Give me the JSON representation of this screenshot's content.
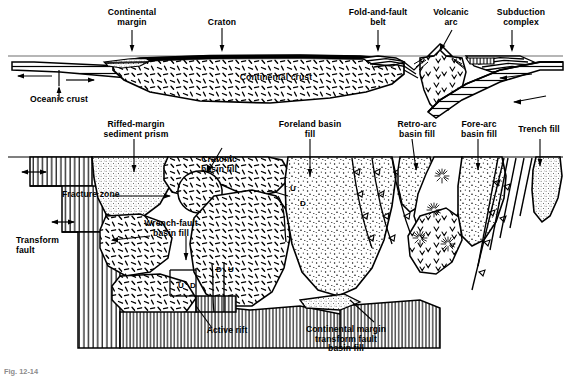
{
  "figure": {
    "kind": "geologic-cross-section",
    "caption": "Fig. 12-14",
    "panels": [
      {
        "name": "upper-panel",
        "title": "plate-tectonic settings"
      },
      {
        "name": "lower-panel",
        "title": "basin fill types"
      }
    ]
  },
  "upper": {
    "labels": {
      "continental_margin": "Continental\nmargin",
      "craton": "Craton",
      "fold_and_fault_belt": "Fold-and-fault\nbelt",
      "volcanic_arc": "Volcanic\narc",
      "subduction_complex": "Subduction\ncomplex",
      "oceanic_crust": "Oceanic crust",
      "continental_crust": "Continental crust"
    }
  },
  "lower": {
    "labels": {
      "rifted_margin_sediment_prism": "Riffed-margin\nsediment prism",
      "foreland_basin_fill": "Foreland basin\nfill",
      "retro_arc_basin_fill": "Retro-arc\nbasin fill",
      "fore_arc_basin_fill": "Fore-arc\nbasin fill",
      "trench_fill": "Trench fill",
      "cratonic_basin_fill": "Cratonic\nbasin fill",
      "fracture_zone": "Fracture zone",
      "transform_fault": "Transform\nfault",
      "wrench_fault_basin_fill": "Wrench-fault\nbasin fill",
      "active_rift": "Active rift",
      "continental_margin_transform_fault_basin_fill": "Continental margin\ntransform fault\nbasin fill"
    },
    "fault_markers": [
      {
        "name": "up-marker-1",
        "text": "U"
      },
      {
        "name": "down-marker-1",
        "text": "D"
      },
      {
        "name": "down-marker-2",
        "text": "D"
      },
      {
        "name": "up-marker-2",
        "text": "U"
      },
      {
        "name": "up-marker-3",
        "text": "U"
      },
      {
        "name": "down-marker-3",
        "text": "D"
      }
    ]
  },
  "colors": {
    "ink": "#000000",
    "paper": "#ffffff",
    "caption": "#8c8c8c",
    "sea_level_line": "#6f6f6f"
  }
}
